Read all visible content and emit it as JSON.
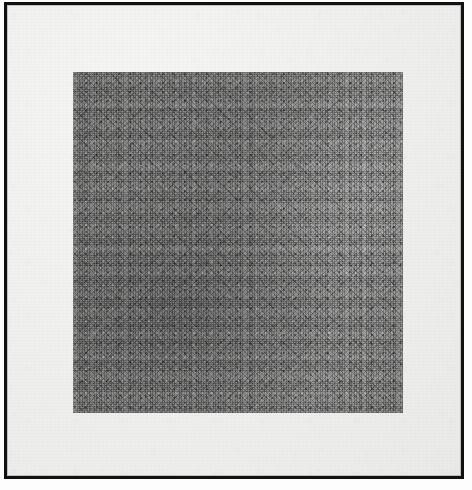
{
  "plate": {
    "medium_label": "graphite drawing reproduction",
    "paper_color": "#f1f1f0",
    "frame_color": "#111111",
    "page_color": "#fdfdfd"
  },
  "artwork": {
    "name": "crosshatched-grey-square",
    "shape": "square",
    "fill_color": "#767675",
    "description": "dense multi-directional graphite crosshatching",
    "hatch_directions": [
      "vertical",
      "horizontal",
      "diagonal-45",
      "diagonal-135",
      "diagonal-22",
      "diagonal-158"
    ],
    "tone": {
      "darkest_region": "lower-left",
      "lightest_region": "right-edge",
      "mid_value": "#7a7a79"
    }
  },
  "inscriptions": {
    "left_label": "",
    "right_signature": ""
  },
  "caption": {
    "text": ""
  }
}
